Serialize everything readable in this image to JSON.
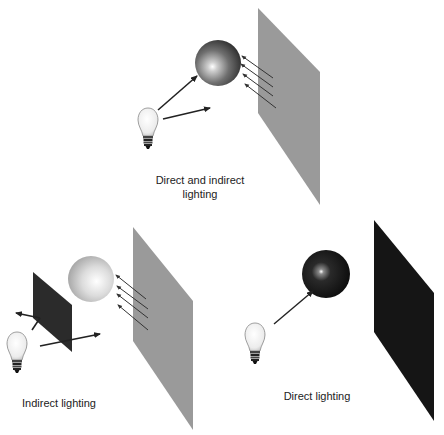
{
  "diagram": {
    "scenes": [
      {
        "id": "direct-and-indirect",
        "caption_line1": "Direct and indirect",
        "caption_line2": "lighting",
        "ball": "medium-gray sphere",
        "wall": "gray panel reflecting light",
        "light_paths": [
          "bulb to sphere (direct)",
          "bulb to wall (indirect)",
          "wall reflects to sphere"
        ]
      },
      {
        "id": "indirect",
        "caption": "Indirect lighting",
        "ball": "light-gray sphere",
        "blocker": "dark panel blocking direct light",
        "wall": "gray panel reflecting light",
        "light_paths": [
          "bulb blocked by dark panel",
          "bulb to wall (indirect)",
          "wall reflects to sphere"
        ]
      },
      {
        "id": "direct",
        "caption": "Direct lighting",
        "ball": "dark sphere with highlight",
        "wall": "black panel (no reflection)",
        "light_paths": [
          "bulb to sphere (direct)"
        ]
      }
    ],
    "colors": {
      "gray_wall": "#9a9a9a",
      "dark_blocker": "#2b2b2b",
      "black_wall": "#151515",
      "arrow": "#222222",
      "background": "#ffffff"
    }
  }
}
